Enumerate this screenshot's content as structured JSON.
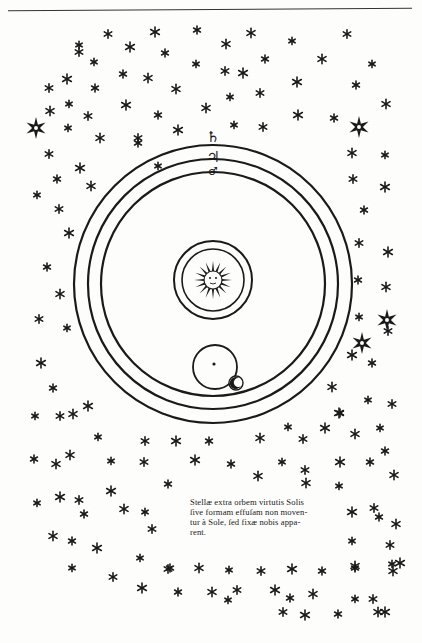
{
  "figure": {
    "ink_color": "#1a1a1a",
    "paper_color": "#fdfdfc"
  },
  "orbits": {
    "center": [
      213,
      284
    ],
    "rings": [
      {
        "name": "outer-ring",
        "radius": 139
      },
      {
        "name": "middle-ring",
        "radius": 125
      },
      {
        "name": "inner-ring",
        "radius": 112
      }
    ],
    "planet_symbols": [
      {
        "name": "saturn",
        "glyph": "♄",
        "x": 213,
        "y": 142
      },
      {
        "name": "jupiter",
        "glyph": "♃",
        "x": 213,
        "y": 162
      },
      {
        "name": "mars",
        "glyph": "♂",
        "x": 213,
        "y": 175
      }
    ]
  },
  "sun": {
    "glyph": "☼",
    "outer_radius": 39,
    "inner_radius": 31
  },
  "earth_moon": {
    "center": [
      215,
      367
    ],
    "radius": 22,
    "moon_glyph": "☾",
    "moon_pos": [
      236,
      383
    ]
  },
  "caption": {
    "lines": [
      "Stellæ extra orbem virtutis Solis",
      "ſive formam effuſam non moven-",
      "tur à Sole, ſed fixæ nobis appa-",
      "rent."
    ]
  },
  "stars_large": [
    [
      36,
      128
    ],
    [
      359,
      127
    ],
    [
      387,
      320
    ],
    [
      362,
      343
    ]
  ],
  "stars": [
    [
      79,
      45
    ],
    [
      108,
      34
    ],
    [
      155,
      32
    ],
    [
      197,
      30
    ],
    [
      251,
      33
    ],
    [
      292,
      41
    ],
    [
      347,
      34
    ],
    [
      130,
      47
    ],
    [
      165,
      53
    ],
    [
      226,
      44
    ],
    [
      94,
      62
    ],
    [
      79,
      52
    ],
    [
      94,
      62
    ],
    [
      123,
      74
    ],
    [
      148,
      78
    ],
    [
      196,
      64
    ],
    [
      225,
      71
    ],
    [
      243,
      73
    ],
    [
      265,
      59
    ],
    [
      322,
      59
    ],
    [
      372,
      64
    ],
    [
      49,
      88
    ],
    [
      67,
      79
    ],
    [
      95,
      88
    ],
    [
      176,
      89
    ],
    [
      230,
      97
    ],
    [
      260,
      93
    ],
    [
      297,
      82
    ],
    [
      356,
      85
    ],
    [
      50,
      111
    ],
    [
      69,
      104
    ],
    [
      88,
      116
    ],
    [
      126,
      105
    ],
    [
      158,
      115
    ],
    [
      206,
      108
    ],
    [
      234,
      125
    ],
    [
      263,
      127
    ],
    [
      298,
      115
    ],
    [
      334,
      118
    ],
    [
      386,
      104
    ],
    [
      68,
      128
    ],
    [
      138,
      138
    ],
    [
      178,
      130
    ],
    [
      138,
      143
    ],
    [
      100,
      138
    ],
    [
      158,
      166
    ],
    [
      49,
      154
    ],
    [
      80,
      168
    ],
    [
      57,
      179
    ],
    [
      91,
      186
    ],
    [
      37,
      195
    ],
    [
      59,
      209
    ],
    [
      69,
      233
    ],
    [
      47,
      267
    ],
    [
      60,
      294
    ],
    [
      67,
      328
    ],
    [
      39,
      319
    ],
    [
      41,
      363
    ],
    [
      53,
      388
    ],
    [
      73,
      414
    ],
    [
      35,
      416
    ],
    [
      60,
      416
    ],
    [
      88,
      406
    ],
    [
      34,
      459
    ],
    [
      70,
      455
    ],
    [
      98,
      437
    ],
    [
      145,
      441
    ],
    [
      176,
      441
    ],
    [
      209,
      441
    ],
    [
      260,
      438
    ],
    [
      288,
      427
    ],
    [
      303,
      439
    ],
    [
      325,
      428
    ],
    [
      340,
      413
    ],
    [
      355,
      434
    ],
    [
      380,
      428
    ],
    [
      353,
      179
    ],
    [
      385,
      187
    ],
    [
      364,
      210
    ],
    [
      352,
      153
    ],
    [
      385,
      155
    ],
    [
      359,
      243
    ],
    [
      388,
      252
    ],
    [
      358,
      280
    ],
    [
      386,
      287
    ],
    [
      359,
      317
    ],
    [
      388,
      331
    ],
    [
      352,
      355
    ],
    [
      372,
      363
    ],
    [
      332,
      387
    ],
    [
      368,
      400
    ],
    [
      392,
      404
    ],
    [
      339,
      413
    ],
    [
      385,
      451
    ],
    [
      56,
      464
    ],
    [
      111,
      461
    ],
    [
      144,
      462
    ],
    [
      195,
      460
    ],
    [
      231,
      464
    ],
    [
      258,
      476
    ],
    [
      282,
      462
    ],
    [
      305,
      470
    ],
    [
      340,
      462
    ],
    [
      370,
      462
    ],
    [
      394,
      475
    ],
    [
      37,
      503
    ],
    [
      79,
      500
    ],
    [
      111,
      491
    ],
    [
      168,
      484
    ],
    [
      306,
      483
    ],
    [
      339,
      486
    ],
    [
      374,
      508
    ],
    [
      60,
      497
    ],
    [
      84,
      514
    ],
    [
      124,
      509
    ],
    [
      145,
      512
    ],
    [
      152,
      529
    ],
    [
      97,
      548
    ],
    [
      72,
      541
    ],
    [
      53,
      536
    ],
    [
      140,
      558
    ],
    [
      168,
      569
    ],
    [
      352,
      512
    ],
    [
      379,
      517
    ],
    [
      396,
      524
    ],
    [
      352,
      541
    ],
    [
      390,
      545
    ],
    [
      400,
      563
    ],
    [
      355,
      568
    ],
    [
      393,
      571
    ],
    [
      72,
      568
    ],
    [
      113,
      577
    ],
    [
      142,
      588
    ],
    [
      178,
      592
    ],
    [
      212,
      592
    ],
    [
      228,
      600
    ],
    [
      237,
      590
    ],
    [
      275,
      590
    ],
    [
      290,
      598
    ],
    [
      313,
      594
    ],
    [
      355,
      599
    ],
    [
      373,
      599
    ],
    [
      385,
      612
    ],
    [
      170,
      568
    ],
    [
      199,
      568
    ],
    [
      229,
      570
    ],
    [
      261,
      571
    ],
    [
      292,
      569
    ],
    [
      322,
      571
    ],
    [
      355,
      566
    ],
    [
      392,
      564
    ],
    [
      283,
      612
    ],
    [
      305,
      615
    ],
    [
      338,
      614
    ],
    [
      378,
      612
    ]
  ]
}
